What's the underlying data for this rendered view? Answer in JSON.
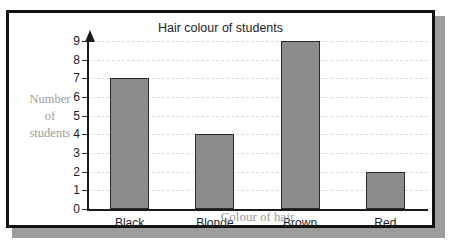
{
  "page": {
    "cut_off_text": "Bar graph"
  },
  "figure": {
    "frame_color": "#15130f",
    "shadow_color": "#9d9d9d",
    "background": "#ffffff"
  },
  "chart_data": {
    "type": "bar",
    "title": "Hair colour of students",
    "xlabel": "Colour of hair",
    "ylabel": "Number of students",
    "ylabel_lines": [
      "Number",
      "of",
      "students"
    ],
    "categories": [
      "Black",
      "Blonde",
      "Brown",
      "Red"
    ],
    "values": [
      7,
      4,
      9,
      2
    ],
    "ylim": [
      0,
      9
    ],
    "ytick_labels": [
      "0",
      "1",
      "2",
      "3",
      "4",
      "5",
      "6",
      "7",
      "8",
      "9"
    ],
    "yticks": [
      0,
      1,
      2,
      3,
      4,
      5,
      6,
      7,
      8,
      9
    ],
    "grid": true,
    "grid_style": "dashed",
    "grid_color": "#dcdcdc",
    "legend": false,
    "bar_fill_color": "#8c8c8c",
    "bar_edge_color": "#2a2a2a",
    "axis_color": "#1a1a1a",
    "axis_title_color": "#9b9b9b",
    "y_axis_arrow": true
  }
}
